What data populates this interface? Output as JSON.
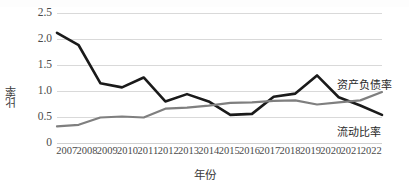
{
  "chart_data": {
    "type": "line",
    "title": "",
    "xlabel": "年份",
    "ylabel": "比率",
    "categories": [
      "2007",
      "2008",
      "2009",
      "2010",
      "2011",
      "2012",
      "2013",
      "2014",
      "2015",
      "2016",
      "2017",
      "2018",
      "2019",
      "2020",
      "2021",
      "2022"
    ],
    "ylim": [
      0,
      2.5
    ],
    "yticks": [
      "0",
      "0.5",
      "1.0",
      "1.5",
      "2.0",
      "2.5"
    ],
    "ytick_values": [
      0,
      0.5,
      1.0,
      1.5,
      2.0,
      2.5
    ],
    "grid": true,
    "legend_position": "inline-right",
    "series": [
      {
        "name": "资产负债率",
        "color": "#1a1a1a",
        "width": 2.6,
        "values": [
          2.12,
          1.88,
          1.15,
          1.07,
          1.26,
          0.8,
          0.94,
          0.8,
          0.54,
          0.56,
          0.89,
          0.95,
          1.3,
          0.88,
          0.72,
          0.54
        ]
      },
      {
        "name": "流动比率",
        "color": "#7f7f7f",
        "width": 2.2,
        "values": [
          0.32,
          0.35,
          0.49,
          0.51,
          0.49,
          0.66,
          0.68,
          0.72,
          0.77,
          0.78,
          0.81,
          0.82,
          0.74,
          0.78,
          0.82,
          0.98
        ]
      }
    ],
    "annotations": [
      {
        "name": "资产负债率",
        "x": "2022",
        "y": 1.22
      },
      {
        "name": "流动比率",
        "x": "2022",
        "y": 0.4
      }
    ]
  },
  "axis": {
    "y_title": "比率",
    "x_title": "年份"
  },
  "labels": {
    "asset_liability": "资产负债率",
    "current_ratio": "流动比率"
  }
}
